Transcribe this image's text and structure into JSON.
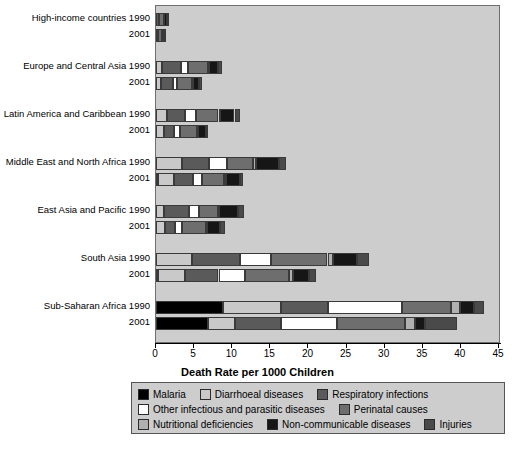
{
  "chart_data": {
    "type": "bar",
    "orientation": "horizontal",
    "stacked": true,
    "title": "",
    "xlabel": "Death Rate per 1000 Children",
    "ylabel": "",
    "xlim": [
      0,
      45
    ],
    "xticks": [
      0,
      5,
      10,
      15,
      20,
      25,
      30,
      35,
      40,
      45
    ],
    "grid": false,
    "legend_position": "bottom",
    "series": [
      {
        "name": "Malaria",
        "color": "#000000"
      },
      {
        "name": "Diarrhoeal diseases",
        "color": "#c9c9c9"
      },
      {
        "name": "Respiratory infections",
        "color": "#5a5a5a"
      },
      {
        "name": "Other infectious and parasitic diseases",
        "color": "#ffffff"
      },
      {
        "name": "Perinatal causes",
        "color": "#6e6e6e"
      },
      {
        "name": "Nutritional deficiencies",
        "color": "#b0b0b0"
      },
      {
        "name": "Non-communicable diseases",
        "color": "#161616"
      },
      {
        "name": "Injuries",
        "color": "#4a4a4a"
      }
    ],
    "groups": [
      {
        "label": "High-income countries",
        "rows": [
          {
            "year": "1990",
            "total": 1.5,
            "values": [
              0.0,
              0.05,
              0.3,
              0.05,
              0.6,
              0.0,
              0.4,
              0.1
            ]
          },
          {
            "year": "2001",
            "total": 1.2,
            "values": [
              0.0,
              0.05,
              0.2,
              0.05,
              0.5,
              0.0,
              0.3,
              0.1
            ]
          }
        ]
      },
      {
        "label": "Europe and Central Asia",
        "rows": [
          {
            "year": "1990",
            "total": 8.6,
            "values": [
              0.0,
              0.8,
              2.5,
              0.9,
              2.6,
              0.1,
              1.2,
              0.5
            ]
          },
          {
            "year": "2001",
            "total": 6.0,
            "values": [
              0.0,
              0.6,
              1.6,
              0.6,
              1.9,
              0.1,
              0.9,
              0.3
            ]
          }
        ]
      },
      {
        "label": "Latin America and Caribbean",
        "rows": [
          {
            "year": "1990",
            "total": 11.0,
            "values": [
              0.0,
              1.5,
              2.3,
              1.4,
              3.0,
              0.2,
              1.9,
              0.7
            ]
          },
          {
            "year": "2001",
            "total": 6.8,
            "values": [
              0.0,
              1.0,
              1.4,
              0.8,
              2.2,
              0.1,
              1.0,
              0.3
            ]
          }
        ]
      },
      {
        "label": "Middle East and North Africa",
        "rows": [
          {
            "year": "1990",
            "total": 17.0,
            "values": [
              0.0,
              3.4,
              3.6,
              2.3,
              3.4,
              0.4,
              3.1,
              0.8
            ]
          },
          {
            "year": "2001",
            "total": 11.4,
            "values": [
              0.2,
              2.2,
              2.4,
              1.2,
              2.9,
              0.3,
              1.8,
              0.4
            ]
          }
        ]
      },
      {
        "label": "East Asia and Pacific",
        "rows": [
          {
            "year": "1990",
            "total": 11.6,
            "values": [
              0.0,
              1.1,
              3.2,
              1.3,
              2.5,
              0.2,
              2.5,
              0.8
            ]
          },
          {
            "year": "2001",
            "total": 9.0,
            "values": [
              0.0,
              1.2,
              1.3,
              0.9,
              3.1,
              0.2,
              1.7,
              0.6
            ]
          }
        ]
      },
      {
        "label": "South Asia",
        "rows": [
          {
            "year": "1990",
            "total": 28.0,
            "values": [
              0.0,
              4.7,
              6.3,
              4.1,
              7.4,
              0.7,
              3.2,
              1.6
            ]
          },
          {
            "year": "2001",
            "total": 21.0,
            "values": [
              0.3,
              3.5,
              4.4,
              3.5,
              5.8,
              0.5,
              2.1,
              0.9
            ]
          }
        ]
      },
      {
        "label": "Sub-Saharan Africa",
        "rows": [
          {
            "year": "1990",
            "total": 43.0,
            "values": [
              8.8,
              7.6,
              6.2,
              9.7,
              6.4,
              1.2,
              1.8,
              1.3
            ]
          },
          {
            "year": "2001",
            "total": 39.5,
            "values": [
              6.8,
              3.6,
              6.0,
              7.3,
              9.0,
              1.3,
              1.3,
              4.2
            ]
          }
        ]
      }
    ]
  },
  "legend": {
    "rows": [
      [
        {
          "label": "Malaria",
          "color": "#000000"
        },
        {
          "label": "Diarrhoeal diseases",
          "color": "#c9c9c9"
        },
        {
          "label": "Respiratory infections",
          "color": "#5a5a5a"
        }
      ],
      [
        {
          "label": "Other infectious and parasitic diseases",
          "color": "#ffffff"
        },
        {
          "label": "Perinatal causes",
          "color": "#6e6e6e"
        }
      ],
      [
        {
          "label": "Nutritional deficiencies",
          "color": "#b0b0b0"
        },
        {
          "label": "Non-communicable diseases",
          "color": "#161616"
        },
        {
          "label": "Injuries",
          "color": "#4a4a4a"
        }
      ]
    ]
  },
  "colors": {
    "plot_background": "#cdcdcd",
    "page_background": "#ffffff",
    "axis": "#000000",
    "bar_outline": "#3a3a3a"
  }
}
